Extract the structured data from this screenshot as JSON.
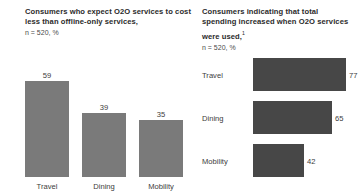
{
  "chart_data": [
    {
      "type": "bar",
      "orientation": "vertical",
      "title": "Consumers who expect O2O services to cost less than offline-only services,",
      "subtitle": "n = 520, %",
      "xlabel": "",
      "ylabel": "",
      "categories": [
        "Travel",
        "Dining",
        "Mobility"
      ],
      "values": [
        59,
        39,
        35
      ],
      "ylim": [
        0,
        100
      ],
      "grid": false,
      "legend": "none",
      "bar_color": "#7a7a7a",
      "value_labels": [
        "59",
        "39",
        "35"
      ]
    },
    {
      "type": "bar",
      "orientation": "horizontal",
      "title": "Consumers indicating that total spending increased when O2O services were used,",
      "footnote_marker": "1",
      "subtitle": "n = 520, %",
      "xlabel": "",
      "ylabel": "",
      "categories": [
        "Travel",
        "Dining",
        "Mobility"
      ],
      "values": [
        77,
        65,
        42
      ],
      "xlim": [
        0,
        100
      ],
      "grid": false,
      "legend": "none",
      "bar_color": "#474747",
      "value_labels": [
        "77",
        "65",
        "42"
      ]
    }
  ],
  "left_panel": {
    "title": "Consumers who expect O2O services to cost less than offline-only services,",
    "sample_note": "n = 520, %",
    "bars": [
      {
        "label": "Travel",
        "value": 59,
        "value_label": "59"
      },
      {
        "label": "Dining",
        "value": 39,
        "value_label": "39"
      },
      {
        "label": "Mobility",
        "value": 35,
        "value_label": "35"
      }
    ]
  },
  "right_panel": {
    "title": "Consumers indicating that total spending increased when O2O services were used,",
    "footnote_marker": "1",
    "sample_note": "n = 520, %",
    "bars": [
      {
        "label": "Travel",
        "value": 77,
        "value_label": "77"
      },
      {
        "label": "Dining",
        "value": 65,
        "value_label": "65"
      },
      {
        "label": "Mobility",
        "value": 42,
        "value_label": "42"
      }
    ]
  }
}
